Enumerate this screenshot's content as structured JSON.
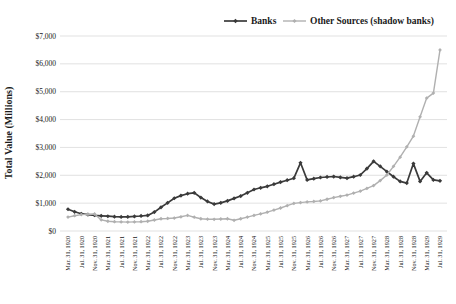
{
  "chart_data": {
    "type": "line",
    "title": "",
    "ylabel": "Total Value (Millions)",
    "legend_position": "top-center",
    "grid": "horizontal",
    "background": "#ffffff",
    "gridline_color": "#d9d9d9",
    "ylim": [
      0,
      7000
    ],
    "yticks": [
      0,
      1000,
      2000,
      3000,
      4000,
      5000,
      6000,
      7000
    ],
    "ytick_labels": [
      "$0",
      "$1,000",
      "$2,000",
      "$3,000",
      "$4,000",
      "$5,000",
      "$6,000",
      "$7,000"
    ],
    "x_sampling": "bimonthly (two data points per axis label)",
    "points_per_label": 2,
    "n_points": 57,
    "x_labels": [
      "Mar. 31, 1920",
      "Jul. 31, 1920",
      "Nov. 31, 1920",
      "Mar. 31, 1921",
      "Jul. 31, 1921",
      "Nov. 31, 1921",
      "Mar. 31, 1922",
      "Jul. 31, 1922",
      "Nov. 31, 1922",
      "Mar. 31, 1923",
      "Jul. 31, 1923",
      "Nov. 31, 1923",
      "Mar. 31, 1924",
      "Jul. 31, 1924",
      "Nov. 31, 1924",
      "Mar. 31, 1925",
      "Jul. 31, 1925",
      "Nov. 31, 1925",
      "Mar. 31, 1926",
      "Jul. 31, 1926",
      "Nov. 31, 1926",
      "Mar. 31, 1927",
      "Jul. 31, 1927",
      "Nov. 31, 1927",
      "Mar. 31, 1928",
      "Jul. 31, 1928",
      "Nov. 31, 1928",
      "Mar. 31, 1929",
      "Jul. 31, 1929"
    ],
    "series": [
      {
        "name": "Banks",
        "color": "#3a3a3a",
        "marker": "diamond",
        "values": [
          780,
          690,
          620,
          590,
          565,
          545,
          530,
          515,
          505,
          510,
          525,
          540,
          560,
          680,
          850,
          1010,
          1175,
          1270,
          1340,
          1370,
          1200,
          1060,
          965,
          1010,
          1080,
          1170,
          1255,
          1370,
          1490,
          1550,
          1605,
          1680,
          1755,
          1825,
          1895,
          2450,
          1835,
          1880,
          1920,
          1940,
          1955,
          1925,
          1895,
          1950,
          2010,
          2240,
          2500,
          2320,
          2130,
          1950,
          1780,
          1720,
          2420,
          1780,
          2090,
          1835,
          1800
        ]
      },
      {
        "name": "Other Sources (shadow banks)",
        "color": "#b0b0b0",
        "marker": "diamond",
        "values": [
          500,
          550,
          590,
          600,
          610,
          400,
          350,
          335,
          325,
          320,
          325,
          335,
          350,
          395,
          440,
          450,
          465,
          510,
          560,
          495,
          440,
          425,
          420,
          430,
          440,
          385,
          440,
          500,
          560,
          615,
          675,
          750,
          825,
          910,
          990,
          1020,
          1045,
          1060,
          1080,
          1140,
          1200,
          1245,
          1290,
          1360,
          1430,
          1530,
          1630,
          1810,
          2010,
          2320,
          2650,
          3020,
          3405,
          4100,
          4770,
          4950,
          6500
        ]
      }
    ]
  }
}
